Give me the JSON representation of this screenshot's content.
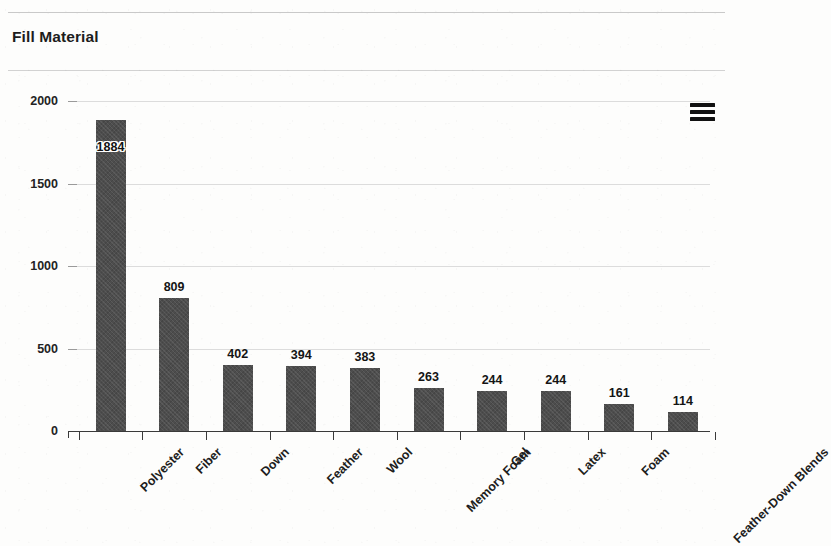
{
  "header": {
    "title": "Fill Material",
    "menu_icon": "hamburger-menu-icon"
  },
  "chart_data": {
    "type": "bar",
    "title": "Fill Material",
    "xlabel": "",
    "ylabel": "",
    "ylim": [
      0,
      2000
    ],
    "yticks": [
      0,
      500,
      1000,
      1500,
      2000
    ],
    "ytick_labels": [
      "0",
      "500",
      "1000",
      "1500",
      "2000"
    ],
    "grid": true,
    "legend": null,
    "bar_color": "#4d4d4d",
    "categories": [
      "Polyester",
      "Fiber",
      "Down",
      "Feather",
      "Wool",
      "Memory Foam",
      "Gel",
      "Latex",
      "Foam",
      "Feather-Down Blends"
    ],
    "values": [
      1884,
      809,
      402,
      394,
      383,
      263,
      244,
      244,
      161,
      114
    ],
    "value_labels": [
      "1884",
      "809",
      "402",
      "394",
      "383",
      "263",
      "244",
      "244",
      "161",
      "114"
    ]
  }
}
